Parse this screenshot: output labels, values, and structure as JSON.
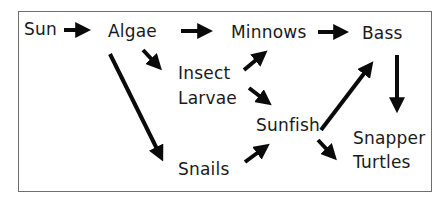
{
  "diagram": {
    "type": "food-web",
    "nodes": {
      "sun": "Sun",
      "algae": "Algae",
      "minnows": "Minnows",
      "bass": "Bass",
      "insect_larvae_line1": "Insect",
      "insect_larvae_line2": "Larvae",
      "sunfish": "Sunfish",
      "snails": "Snails",
      "snapper_turtles_line1": "Snapper",
      "snapper_turtles_line2": "Turtles"
    },
    "edges": [
      {
        "from": "Sun",
        "to": "Algae"
      },
      {
        "from": "Algae",
        "to": "Minnows"
      },
      {
        "from": "Minnows",
        "to": "Bass"
      },
      {
        "from": "Algae",
        "to": "Insect Larvae"
      },
      {
        "from": "Algae",
        "to": "Snails"
      },
      {
        "from": "Insect Larvae",
        "to": "Minnows"
      },
      {
        "from": "Insect Larvae",
        "to": "Sunfish"
      },
      {
        "from": "Snails",
        "to": "Sunfish"
      },
      {
        "from": "Sunfish",
        "to": "Bass"
      },
      {
        "from": "Sunfish",
        "to": "Snapper Turtles"
      },
      {
        "from": "Bass",
        "to": "Snapper Turtles"
      }
    ],
    "colors": {
      "arrow": "#0a0a0a",
      "text": "#1a1a1a",
      "border": "#6e6e6e"
    }
  }
}
